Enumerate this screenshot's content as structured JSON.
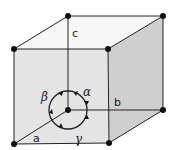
{
  "diagram": {
    "axes": [
      {
        "name": "a",
        "label": "a"
      },
      {
        "name": "b",
        "label": "b"
      },
      {
        "name": "c",
        "label": "c"
      }
    ],
    "angles": [
      {
        "name": "alpha",
        "label": "α"
      },
      {
        "name": "beta",
        "label": "β"
      },
      {
        "name": "gamma",
        "label": "γ"
      }
    ],
    "colors": {
      "front_face": "#e4e4e4",
      "right_face": "#cfcfcf",
      "top_face": "#f7f7f7",
      "edge": "#222222",
      "vertex": "#111111"
    }
  }
}
